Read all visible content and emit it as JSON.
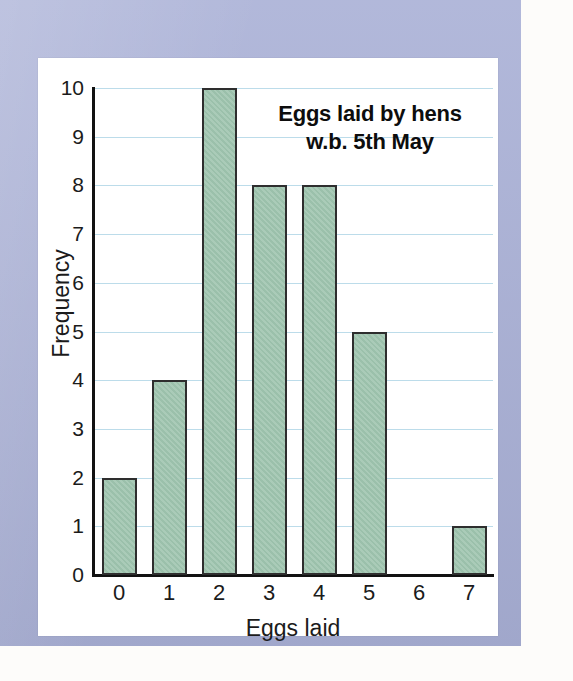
{
  "chart_data": {
    "type": "bar",
    "title": "Eggs laid by hens w.b. 5th May",
    "title_lines": [
      "Eggs laid by hens",
      "w.b. 5th May"
    ],
    "xlabel": "Eggs laid",
    "ylabel": "Frequency",
    "categories": [
      "0",
      "1",
      "2",
      "3",
      "4",
      "5",
      "6",
      "7"
    ],
    "values": [
      2,
      4,
      10,
      8,
      8,
      5,
      0,
      1
    ],
    "ylim": [
      0,
      10
    ],
    "ytick_labels": [
      "0",
      "1",
      "2",
      "3",
      "4",
      "5",
      "6",
      "7",
      "8",
      "9",
      "10"
    ],
    "ytick_values": [
      0,
      1,
      2,
      3,
      4,
      5,
      6,
      7,
      8,
      9,
      10
    ],
    "xtick_labels": [
      "0",
      "1",
      "2",
      "3",
      "4",
      "5",
      "6",
      "7"
    ],
    "grid": true,
    "grid_axis": "y",
    "legend": false,
    "legend_position": "none",
    "bar_color": "#9EC4AE",
    "bar_border_color": "#2E2E2E",
    "gridline_color": "#BCDCEA",
    "axis_color": "#111111"
  },
  "page": {
    "frame_color": "#A9B0D6",
    "panel_color": "#FFFFFF"
  }
}
